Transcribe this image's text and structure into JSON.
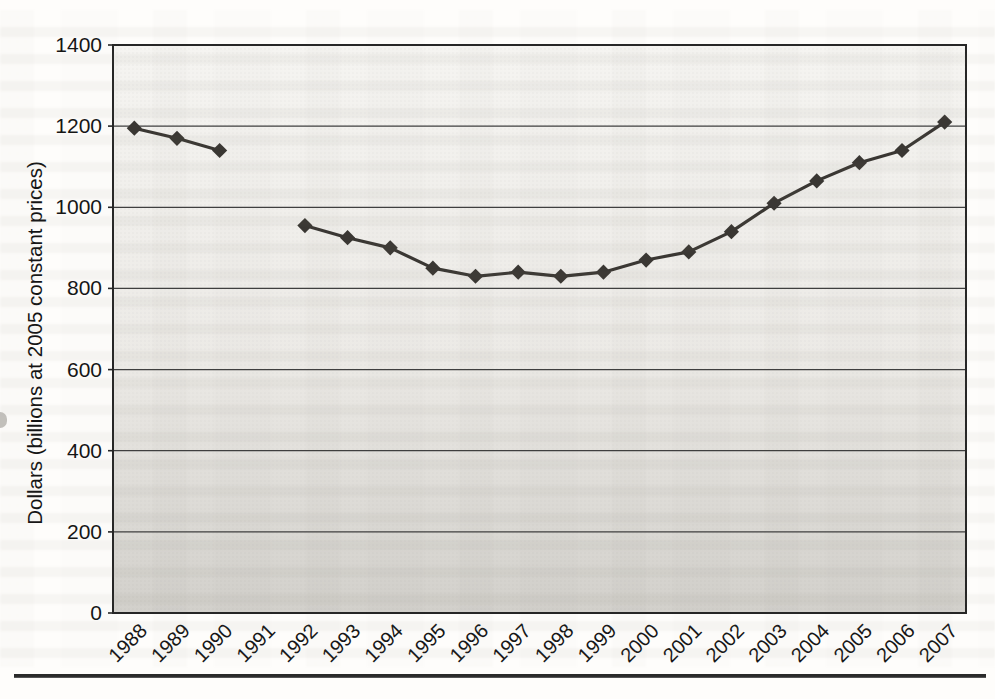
{
  "chart_data": {
    "type": "line",
    "title": "",
    "xlabel": "",
    "ylabel": "Dollars (billions at 2005 constant prices)",
    "categories": [
      "1988",
      "1989",
      "1990",
      "1991",
      "1992",
      "1993",
      "1994",
      "1995",
      "1996",
      "1997",
      "1998",
      "1999",
      "2000",
      "2001",
      "2002",
      "2003",
      "2004",
      "2005",
      "2006",
      "2007"
    ],
    "series": [
      {
        "name": "",
        "values": [
          1195,
          1170,
          1140,
          null,
          955,
          925,
          900,
          850,
          830,
          840,
          830,
          840,
          870,
          890,
          940,
          1010,
          1065,
          1110,
          1140,
          1210
        ]
      }
    ],
    "missing_values": [
      "1991"
    ],
    "ylim": [
      0,
      1400
    ],
    "y_ticks": [
      0,
      200,
      400,
      600,
      800,
      1000,
      1200,
      1400
    ],
    "grid": "horizontal",
    "legend": "none",
    "marker": "diamond",
    "x_label_rotation_deg": 45,
    "colors": {
      "line": "#3a3733",
      "grid": "#3f3f3f",
      "border": "#262626",
      "text": "#161616",
      "plot_bg_top": "#f5f4f1",
      "plot_bg_mid": "#eceae6",
      "plot_bg_bottom": "#d2d0cb",
      "page_bg": "#fefdfb",
      "separator": "#2a2a2a"
    }
  }
}
